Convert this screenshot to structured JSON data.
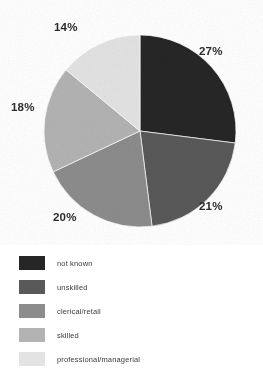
{
  "chart_data": {
    "type": "pie",
    "title": "",
    "subtitle": "",
    "xlabel": "",
    "ylabel": "",
    "legend_position": "bottom-left",
    "grid": false,
    "units": "percent",
    "start_angle_deg": 0,
    "direction": "clockwise",
    "categories": [
      "not known",
      "unskilled",
      "clerical/retail",
      "skilled",
      "professional/managerial"
    ],
    "values": [
      27,
      21,
      20,
      18,
      14
    ],
    "data_labels": [
      "27%",
      "21%",
      "20%",
      "18%",
      "14%"
    ],
    "colors": [
      "#262626",
      "#595959",
      "#8c8c8c",
      "#b3b3b3",
      "#e3e3e3"
    ],
    "slices": [
      {
        "label": "not known",
        "value": 27,
        "display": "27%",
        "color": "#262626"
      },
      {
        "label": "unskilled",
        "value": 21,
        "display": "21%",
        "color": "#595959"
      },
      {
        "label": "clerical/retail",
        "value": 20,
        "display": "20%",
        "color": "#8c8c8c"
      },
      {
        "label": "skilled",
        "value": 18,
        "display": "18%",
        "color": "#b3b3b3"
      },
      {
        "label": "professional/managerial",
        "value": 14,
        "display": "14%",
        "color": "#e3e3e3"
      }
    ]
  },
  "pie": {
    "center_x": 140,
    "center_y": 131,
    "radius": 96,
    "labels": {
      "not_known": "27%",
      "unskilled": "21%",
      "clerical": "20%",
      "skilled": "18%",
      "professional": "14%"
    }
  },
  "legend": {
    "items": [
      {
        "label": "not known",
        "color": "#262626"
      },
      {
        "label": "unskilled",
        "color": "#595959"
      },
      {
        "label": "clerical/retail",
        "color": "#8c8c8c"
      },
      {
        "label": "skilled",
        "color": "#b3b3b3"
      },
      {
        "label": "professional/managerial",
        "color": "#e3e3e3"
      }
    ]
  }
}
